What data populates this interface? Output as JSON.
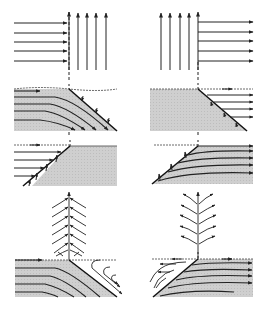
{
  "figure": {
    "colors": {
      "background": "#ffffff",
      "ink": "#222222",
      "shade": "#c8c8c8",
      "shade_dark": "#b4b4b4",
      "dashed": "#333333"
    },
    "panels": [
      {
        "id": "p1",
        "position": "top-left",
        "content": "horizontal arrows converting to vertical arrows at dashed line"
      },
      {
        "id": "p2",
        "position": "top-right",
        "content": "vertical arrows converting to horizontal arrows at dashed line"
      },
      {
        "id": "p3",
        "position": "row2-left",
        "content": "shaded block with curved flow lines toward inclined face"
      },
      {
        "id": "p4",
        "position": "row2-right",
        "content": "shaded block with inclined face, horizontal outflow arrows"
      },
      {
        "id": "p5",
        "position": "row3-left",
        "content": "horizontal arrows entering inclined face of shaded block"
      },
      {
        "id": "p6",
        "position": "row3-right",
        "content": "shaded block with curved flow lines from inclined face"
      },
      {
        "id": "p7",
        "position": "row4-left",
        "content": "converging herringbone flow pattern"
      },
      {
        "id": "p8",
        "position": "row4-right",
        "content": "diverging herringbone flow pattern"
      },
      {
        "id": "p9",
        "position": "bottom-left",
        "content": "shaded block with curved lines and bent flow lines outside"
      },
      {
        "id": "p10",
        "position": "bottom-right",
        "content": "shaded block with curved lines and bent flow lines outside"
      }
    ]
  }
}
